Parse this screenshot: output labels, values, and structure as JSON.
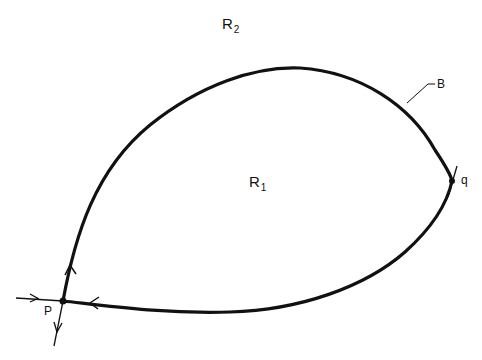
{
  "diagram": {
    "type": "phase-portrait-region",
    "stroke_color": "#111111",
    "background": "#ffffff",
    "labels": {
      "outer_region": {
        "base": "R",
        "sub": "2"
      },
      "inner_region": {
        "base": "R",
        "sub": "1"
      },
      "boundary": "B",
      "point_p": "P",
      "point_q": "q"
    },
    "points": {
      "P": {
        "x": 63,
        "y": 301,
        "kind": "saddle"
      },
      "q": {
        "x": 452,
        "y": 181,
        "kind": "crossing"
      }
    },
    "arrows": [
      {
        "on": "incoming-left-to-P",
        "direction": "right"
      },
      {
        "on": "curve-above-P",
        "direction": "up"
      },
      {
        "on": "bottom-curve-near-P",
        "direction": "left"
      },
      {
        "on": "outgoing-below-P",
        "direction": "down"
      }
    ]
  }
}
